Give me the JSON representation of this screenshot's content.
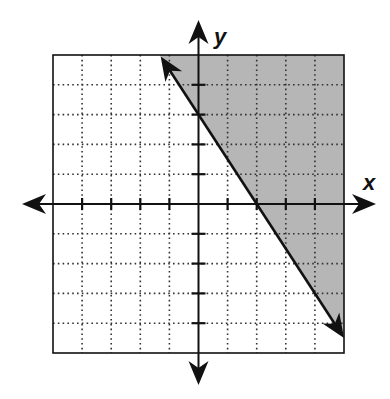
{
  "chart_data": {
    "type": "area",
    "title": "",
    "xlabel": "x",
    "ylabel": "y",
    "xlim": [
      -5,
      5
    ],
    "ylim": [
      -5,
      5
    ],
    "grid": true,
    "grid_style": "dotted",
    "tick_step": 1,
    "series": [
      {
        "name": "boundary line",
        "kind": "line",
        "equation": "y = -1.5x + 3",
        "slope": -1.5,
        "intercept": 3,
        "style": "solid",
        "x": [
          -1.3,
          5
        ],
        "y": [
          4.95,
          -4.5
        ],
        "arrows": "both"
      },
      {
        "name": "solution region",
        "kind": "shaded",
        "inequality": "y >= -1.5x + 3",
        "side": "above-right"
      }
    ],
    "key_points": [
      {
        "label": "y-intercept",
        "x": 0,
        "y": 3
      },
      {
        "label": "x-intercept",
        "x": 2,
        "y": 0
      }
    ],
    "colors": {
      "shade": "#b6b6b6",
      "ink": "#111111",
      "grid": "#333333"
    }
  }
}
